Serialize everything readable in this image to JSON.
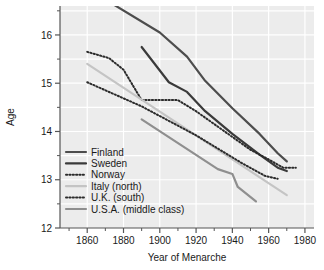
{
  "chart_data": {
    "type": "line",
    "title": "",
    "xlabel": "Year of Menarche",
    "ylabel": "Age",
    "xlim": [
      1845,
      1985
    ],
    "ylim": [
      12,
      16.6
    ],
    "xticks": [
      1860,
      1880,
      1900,
      1920,
      1940,
      1960,
      1980
    ],
    "xtick_labels": [
      "1860",
      "1880",
      "1900",
      "1920",
      "1940",
      "1960",
      "1980"
    ],
    "yticks": [
      12,
      13,
      14,
      15,
      16
    ],
    "ytick_labels": [
      "12",
      "13",
      "14",
      "15",
      "16"
    ],
    "yminor": [
      12.5,
      13.5,
      14.5,
      15.5,
      16.5
    ],
    "grid": true,
    "grid_color": "#ffffff",
    "plot_background": "#ececec",
    "legend_position": "lower-left",
    "series": [
      {
        "name": "Finland",
        "style": "solid",
        "color": "#4d4d4d",
        "width": 2.2,
        "x": [
          1875,
          1900,
          1915,
          1925,
          1940,
          1955,
          1965,
          1970
        ],
        "y": [
          16.62,
          16.05,
          15.55,
          15.05,
          14.48,
          13.95,
          13.55,
          13.38
        ]
      },
      {
        "name": "Sweden",
        "style": "solid",
        "color": "#3a3a3a",
        "width": 2.2,
        "x": [
          1890,
          1905,
          1915,
          1925,
          1940,
          1955,
          1965,
          1970
        ],
        "y": [
          15.75,
          15.02,
          14.82,
          14.42,
          13.95,
          13.52,
          13.25,
          13.18
        ]
      },
      {
        "name": "Norway",
        "style": "dotted",
        "color": "#2b2b2b",
        "width": 2.0,
        "x": [
          1860,
          1872,
          1880,
          1890,
          1910,
          1920,
          1935,
          1950,
          1960,
          1968,
          1975
        ],
        "y": [
          15.65,
          15.52,
          15.28,
          14.65,
          14.65,
          14.42,
          14.02,
          13.62,
          13.42,
          13.25,
          13.25
        ]
      },
      {
        "name": "Italy (north)",
        "style": "solid",
        "color": "#c4c4c4",
        "width": 2.2,
        "x": [
          1860,
          1970
        ],
        "y": [
          15.4,
          12.68
        ]
      },
      {
        "name": "U.K. (south)",
        "style": "dotted",
        "color": "#2b2b2b",
        "width": 2.0,
        "x": [
          1860,
          1890,
          1920,
          1945,
          1958,
          1965
        ],
        "y": [
          15.02,
          14.52,
          13.92,
          13.35,
          13.08,
          13.02
        ]
      },
      {
        "name": "U.S.A. (middle class)",
        "style": "solid",
        "color": "#8f8f8f",
        "width": 2.2,
        "x": [
          1890,
          1932,
          1940,
          1943,
          1953
        ],
        "y": [
          14.25,
          13.22,
          13.12,
          12.85,
          12.55
        ]
      }
    ]
  },
  "legend": {
    "entries": [
      {
        "label": "Finland"
      },
      {
        "label": "Sweden"
      },
      {
        "label": "Norway"
      },
      {
        "label": "Italy (north)"
      },
      {
        "label": "U.K. (south)"
      },
      {
        "label": "U.S.A. (middle class)"
      }
    ]
  }
}
